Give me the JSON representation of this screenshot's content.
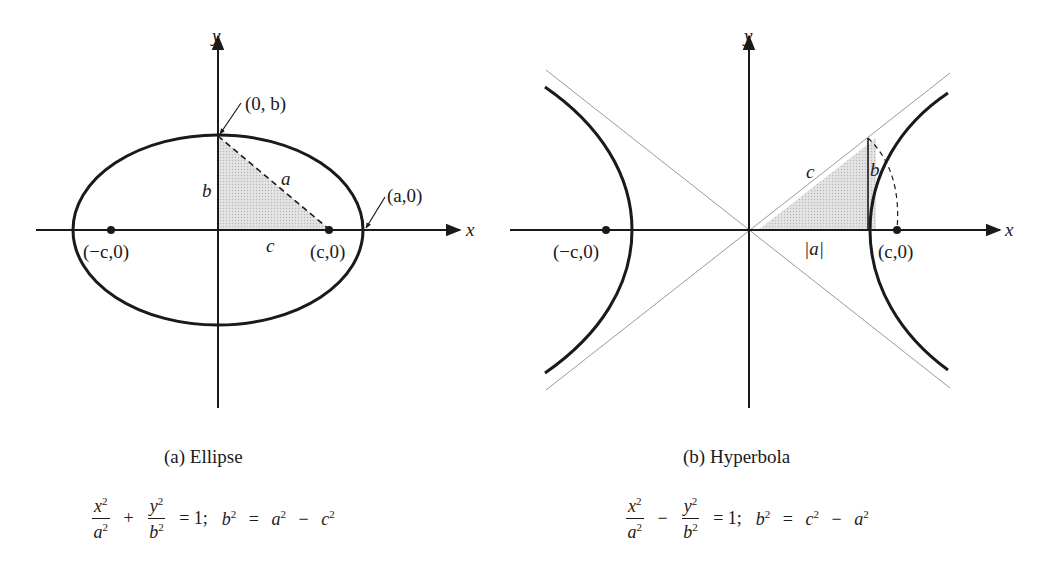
{
  "figures": {
    "ellipse": {
      "caption": "(a) Ellipse",
      "labels": {
        "y_axis": "y",
        "x_axis": "x",
        "vertex_top": "(0, b)",
        "vertex_right": "(a,0)",
        "focus_left": "(−c,0)",
        "focus_right": "(c,0)",
        "side_b": "b",
        "side_a": "a",
        "side_c": "c"
      },
      "equation": {
        "t1_num": "x",
        "t1_den": "a",
        "op1": "+",
        "t2_num": "y",
        "t2_den": "b",
        "rhs": "= 1;",
        "rel_lhs": "b",
        "rel_eq": "=",
        "rel_t1": "a",
        "rel_op": "−",
        "rel_t2": "c",
        "exp": "2"
      }
    },
    "hyperbola": {
      "caption": "(b) Hyperbola",
      "labels": {
        "y_axis": "y",
        "x_axis": "x",
        "focus_left": "(−c,0)",
        "focus_right": "(c,0)",
        "side_c": "c",
        "side_b": "b",
        "side_a": "|a|"
      },
      "equation": {
        "t1_num": "x",
        "t1_den": "a",
        "op1": "−",
        "t2_num": "y",
        "t2_den": "b",
        "rhs": "= 1;",
        "rel_lhs": "b",
        "rel_eq": "=",
        "rel_t1": "c",
        "rel_op": "−",
        "rel_t2": "a",
        "exp": "2"
      }
    }
  },
  "colors": {
    "stroke": "#1a1a1a",
    "shade": "#d9d9d9",
    "asymptote": "#9a9a9a"
  }
}
